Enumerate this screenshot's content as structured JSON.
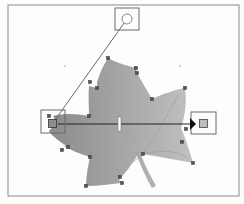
{
  "canvas": {
    "tool": "gradient-tool",
    "frame": {
      "x": 8,
      "y": 5,
      "width": 231,
      "height": 191,
      "stroke": "#8a8a8a"
    },
    "shape": {
      "name": "maple-leaf",
      "fill_start": "#8c8c8c",
      "fill_end": "#c4c4c4",
      "anchor_points": [
        [
          108,
          58
        ],
        [
          136,
          68
        ],
        [
          137,
          73
        ],
        [
          152,
          99
        ],
        [
          185,
          88
        ],
        [
          181,
          128
        ],
        [
          193,
          163
        ],
        [
          141,
          154
        ],
        [
          119,
          179
        ],
        [
          86,
          186
        ],
        [
          90,
          157
        ],
        [
          62,
          145
        ],
        [
          68,
          147
        ],
        [
          89,
          116
        ],
        [
          89,
          86
        ],
        [
          97,
          88
        ],
        [
          97,
          82
        ]
      ]
    },
    "gradient": {
      "start": {
        "x": 53,
        "y": 124,
        "color": "#8c8c8c"
      },
      "end": {
        "x": 202,
        "y": 124,
        "color": "#bdbdbd"
      },
      "midpoint_x": 119,
      "radial_handle": {
        "x": 127,
        "y": 19
      }
    }
  }
}
